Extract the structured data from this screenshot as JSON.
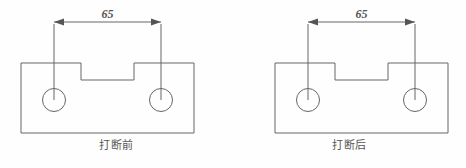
{
  "sheet": {
    "title": "mechanical part break comparison drawing",
    "background_color": "#fefefe",
    "line_color": "#666666",
    "text_color": "#555555"
  },
  "figures": [
    {
      "id": "before",
      "caption": "打断前",
      "dimension": {
        "value": "65",
        "arrow_style": "filled-outward",
        "line_label": "horizontal-dimension-line"
      },
      "geometry": {
        "body_outline": "notched-rectangle",
        "holes": 2,
        "hole_label": "circle-hole"
      }
    },
    {
      "id": "after",
      "caption": "打断后",
      "dimension": {
        "value": "65",
        "arrow_style": "filled-outward",
        "line_label": "horizontal-dimension-line"
      },
      "geometry": {
        "body_outline": "notched-rectangle",
        "holes": 2,
        "hole_label": "circle-hole"
      }
    }
  ]
}
